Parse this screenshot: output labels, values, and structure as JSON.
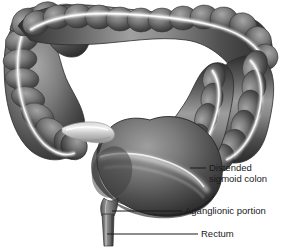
{
  "figure": {
    "background_color": "#ffffff",
    "ink_color": "#1a1a1a",
    "organ_colors": {
      "dark": "#3a3a3a",
      "mid": "#6e6e6e",
      "light": "#a8a8a8",
      "highlight": "#f2f2f2",
      "shadow": "#2a2a2a",
      "outline": "#474747"
    }
  },
  "labels": [
    {
      "id": "distended-sigmoid-colon",
      "lines": [
        "Distended",
        "sigmoid colon"
      ],
      "line1": "Distended",
      "line2": "sigmoid colon",
      "text_x": 209,
      "text_y": 168,
      "leader_x1": 190,
      "leader_y1": 168,
      "leader_x2": 206,
      "leader_y2": 168
    },
    {
      "id": "aganglionic-portion",
      "lines": [
        "Aganglionic portion"
      ],
      "line1": "Aganglionic portion",
      "line2": "",
      "text_x": 185,
      "text_y": 211,
      "leader_x1": 112,
      "leader_y1": 211,
      "leader_x2": 182,
      "leader_y2": 211
    },
    {
      "id": "rectum",
      "lines": [
        "Rectum"
      ],
      "line1": "Rectum",
      "line2": "",
      "text_x": 201,
      "text_y": 234,
      "leader_x1": 107,
      "leader_y1": 234,
      "leader_x2": 198,
      "leader_y2": 234
    }
  ],
  "anatomy_parts": [
    {
      "id": "transverse-colon",
      "name": "Transverse colon"
    },
    {
      "id": "hepatic-flexure",
      "name": "Hepatic flexure"
    },
    {
      "id": "splenic-flexure",
      "name": "Splenic flexure"
    },
    {
      "id": "ascending-colon",
      "name": "Ascending colon"
    },
    {
      "id": "descending-colon",
      "name": "Descending colon"
    },
    {
      "id": "cecum",
      "name": "Cecum"
    },
    {
      "id": "ileum",
      "name": "Terminal ileum"
    },
    {
      "id": "distended-sigmoid",
      "name": "Distended sigmoid colon"
    },
    {
      "id": "aganglionic-segment",
      "name": "Aganglionic portion"
    },
    {
      "id": "rectum",
      "name": "Rectum"
    }
  ]
}
